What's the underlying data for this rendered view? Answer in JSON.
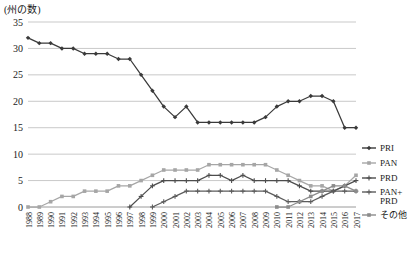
{
  "axis_title": "(州の数)",
  "legend": {
    "position": "right",
    "items": [
      {
        "label": "PRI",
        "color": "#3a3a3a"
      },
      {
        "label": "PAN",
        "color": "#a6a6a6"
      },
      {
        "label": "PRD",
        "color": "#4d4d4d"
      },
      {
        "label": "PAN+PRD",
        "line1": "PAN+",
        "line2": "PRD",
        "color": "#5c5c5c"
      },
      {
        "label": "その他",
        "color": "#8c8c8c"
      }
    ]
  },
  "chart_data": {
    "type": "line",
    "title": "",
    "xlabel": "",
    "ylabel": "(州の数)",
    "ylim": [
      0,
      35
    ],
    "ytick_step": 5,
    "yticks": [
      0,
      5,
      10,
      15,
      20,
      25,
      30,
      35
    ],
    "grid": "horizontal",
    "categories": [
      "1988",
      "1989",
      "1990",
      "1991",
      "1992",
      "1993",
      "1994",
      "1995",
      "1996",
      "1997",
      "1998",
      "1999",
      "2000",
      "2001",
      "2002",
      "2003",
      "2004",
      "2005",
      "2006",
      "2007",
      "2008",
      "2009",
      "2010",
      "2011",
      "2012",
      "2013",
      "2014",
      "2015",
      "2016",
      "2017"
    ],
    "series": [
      {
        "name": "PRI",
        "color": "#3a3a3a",
        "marker": "diamond",
        "values": [
          32,
          31,
          31,
          30,
          30,
          29,
          29,
          29,
          28,
          28,
          25,
          22,
          19,
          17,
          19,
          16,
          16,
          16,
          16,
          16,
          16,
          17,
          19,
          20,
          20,
          21,
          21,
          20,
          15,
          15
        ]
      },
      {
        "name": "PAN",
        "color": "#a6a6a6",
        "marker": "square",
        "values": [
          0,
          0,
          1,
          2,
          2,
          3,
          3,
          3,
          4,
          4,
          5,
          6,
          7,
          7,
          7,
          7,
          8,
          8,
          8,
          8,
          8,
          8,
          7,
          6,
          5,
          4,
          4,
          3,
          4,
          6
        ]
      },
      {
        "name": "PRD",
        "color": "#4d4d4d",
        "marker": "plus",
        "values": [
          null,
          null,
          null,
          null,
          null,
          null,
          null,
          null,
          null,
          0,
          2,
          4,
          5,
          5,
          5,
          5,
          6,
          6,
          5,
          6,
          5,
          5,
          5,
          5,
          4,
          3,
          3,
          3,
          4,
          5
        ]
      },
      {
        "name": "PAN+PRD",
        "color": "#5c5c5c",
        "marker": "plus",
        "values": [
          null,
          null,
          null,
          null,
          null,
          null,
          null,
          null,
          null,
          null,
          null,
          0,
          1,
          2,
          3,
          3,
          3,
          3,
          3,
          3,
          3,
          3,
          2,
          1,
          1,
          1,
          2,
          3,
          3,
          3
        ]
      },
      {
        "name": "その他",
        "color": "#8c8c8c",
        "marker": "square",
        "values": [
          null,
          null,
          null,
          null,
          null,
          null,
          null,
          null,
          null,
          null,
          null,
          null,
          null,
          null,
          null,
          null,
          null,
          null,
          null,
          null,
          null,
          null,
          0,
          0,
          1,
          2,
          3,
          4,
          4,
          3
        ]
      }
    ]
  }
}
